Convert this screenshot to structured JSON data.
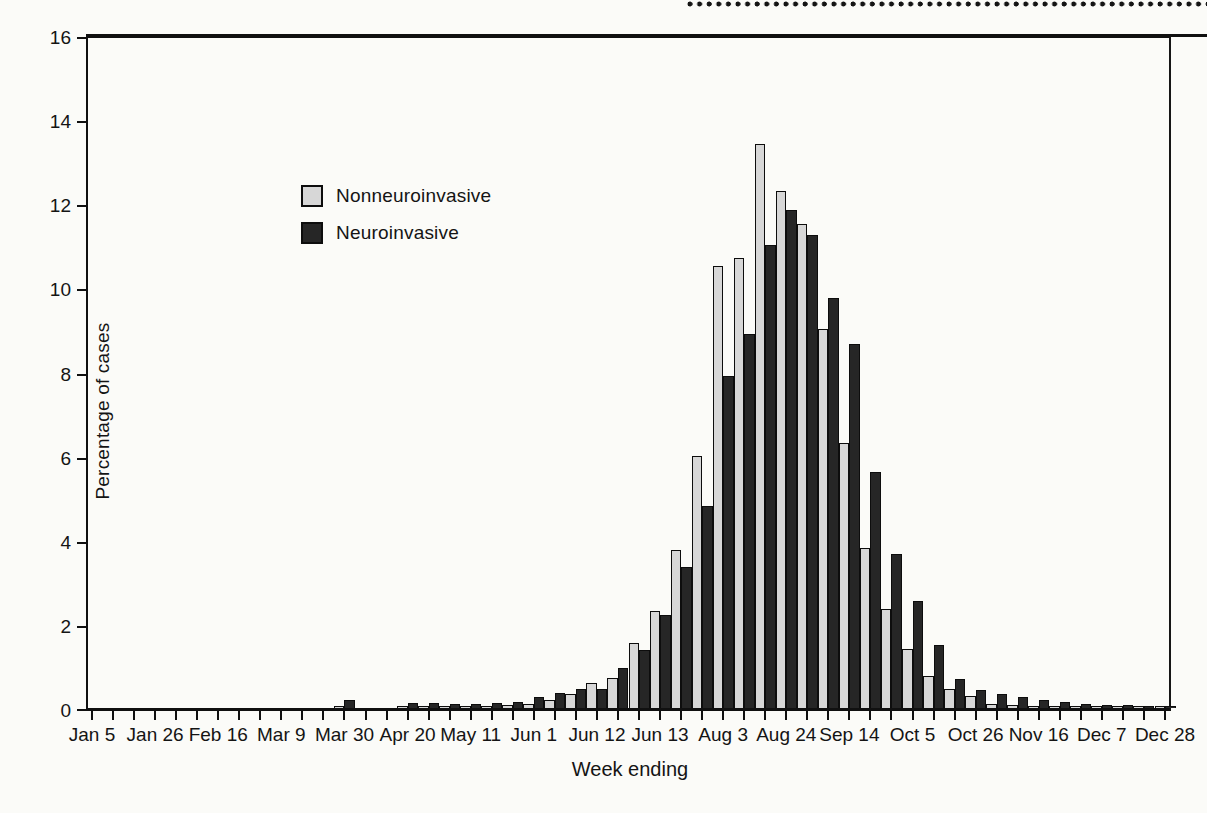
{
  "artifacts": {
    "perforation_dots": "page-edge-dot-row",
    "top_rule_color": "#101010"
  },
  "chart_data": {
    "type": "bar",
    "title": "",
    "xlabel": "Week ending",
    "ylabel": "Percentage of cases",
    "ylim": [
      0,
      16
    ],
    "yticks": [
      0,
      2,
      4,
      6,
      8,
      10,
      12,
      14,
      16
    ],
    "weeks": 52,
    "label_every_n_weeks": 3,
    "x_tick_labels": [
      "Jan 5",
      "Jan 26",
      "Feb 16",
      "Mar 9",
      "Mar 30",
      "Apr 20",
      "May 11",
      "Jun 1",
      "Jun 12",
      "Jun 13",
      "Aug 3",
      "Aug 24",
      "Sep 14",
      "Oct 5",
      "Oct 26",
      "Nov 16",
      "Dec 7",
      "Dec 28"
    ],
    "grid": false,
    "legend_position": "upper-left-inside",
    "legend": [
      {
        "name": "Nonneuroinvasive",
        "color": "#d7d7d7"
      },
      {
        "name": "Neuroinvasive",
        "color": "#262626"
      }
    ],
    "series": [
      {
        "name": "Nonneuroinvasive",
        "color": "#d7d7d7",
        "values": [
          0,
          0,
          0,
          0,
          0,
          0,
          0,
          0,
          0,
          0,
          0,
          0,
          0.05,
          0,
          0,
          0.05,
          0.05,
          0.05,
          0.05,
          0.05,
          0.08,
          0.1,
          0.2,
          0.33,
          0.6,
          0.72,
          1.55,
          2.3,
          3.75,
          6.0,
          10.5,
          10.7,
          13.4,
          12.3,
          11.5,
          9.0,
          6.3,
          3.8,
          2.35,
          1.4,
          0.75,
          0.45,
          0.28,
          0.1,
          0.07,
          0.05,
          0.04,
          0.03,
          0.03,
          0.02,
          0.02,
          0.02
        ]
      },
      {
        "name": "Neuroinvasive",
        "color": "#262626",
        "values": [
          0,
          0,
          0,
          0,
          0,
          0,
          0,
          0,
          0,
          0,
          0,
          0,
          0.2,
          0,
          0,
          0.12,
          0.12,
          0.1,
          0.1,
          0.12,
          0.15,
          0.26,
          0.36,
          0.46,
          0.46,
          0.95,
          1.38,
          2.2,
          3.35,
          4.8,
          7.9,
          8.9,
          11.0,
          11.85,
          11.25,
          9.75,
          8.65,
          5.6,
          3.65,
          2.55,
          1.5,
          0.7,
          0.42,
          0.33,
          0.25,
          0.2,
          0.15,
          0.1,
          0.08,
          0.07,
          0.05,
          0.04
        ]
      }
    ]
  }
}
